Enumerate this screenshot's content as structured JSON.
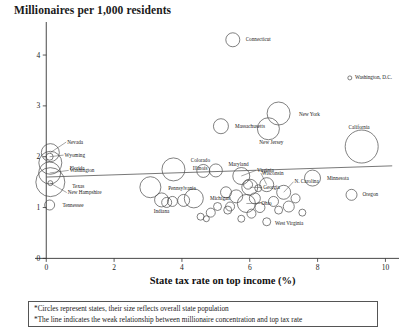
{
  "chart_data": {
    "type": "scatter",
    "title": "Millionaires per 1,000 residents",
    "xlabel": "State tax rate on top income (%)",
    "ylabel": "Millionaires per 1,000 residents",
    "xlim": [
      -0.45,
      10.4
    ],
    "ylim": [
      -0.15,
      4.65
    ],
    "xticks": [
      "0",
      "2",
      "4",
      "6",
      "8",
      "10"
    ],
    "xtickvals": [
      0,
      2,
      4,
      6,
      8,
      10
    ],
    "yticks": [
      "0",
      "1",
      "2",
      "3",
      "4"
    ],
    "ytickvals": [
      0,
      1,
      2,
      3,
      4
    ],
    "grid": false,
    "legend": "none",
    "marker_shape": "open-circle",
    "size_meaning": "overall state population",
    "trendline": {
      "label": "weak positive relationship",
      "x_start": 0.0,
      "y_start": 1.6,
      "x_end": 10.2,
      "y_end": 1.82
    },
    "points": [
      {
        "label": "Connecticut",
        "x": 5.5,
        "y": 4.3,
        "r": 7.0,
        "label_dx": 9,
        "label_dy": 1.5,
        "leader": false
      },
      {
        "label": "Washington, D.C.",
        "x": 8.95,
        "y": 3.55,
        "r": 2.0,
        "label_dx": 4,
        "label_dy": 1.5,
        "leader": false
      },
      {
        "label": "New York",
        "x": 6.85,
        "y": 2.85,
        "r": 11.5,
        "label_dx": 14,
        "label_dy": 2.0,
        "leader": false
      },
      {
        "label": "New Jersey",
        "x": 6.55,
        "y": 2.55,
        "r": 11.0,
        "label_dx": -3,
        "label_dy": 15.0,
        "leader": false
      },
      {
        "label": "Massachusetts",
        "x": 5.15,
        "y": 2.6,
        "r": 7.5,
        "label_dx": 10,
        "label_dy": 1.5,
        "leader": false
      },
      {
        "label": "California",
        "x": 9.3,
        "y": 2.2,
        "r": 16.5,
        "label_dx": -4,
        "label_dy": -18.0,
        "leader": false
      },
      {
        "label": "Nevada",
        "x": 0.12,
        "y": 2.08,
        "r": 9.0,
        "label_dx": 12,
        "label_dy": -9.0,
        "leader": true
      },
      {
        "label": "Wyoming",
        "x": 0.1,
        "y": 2.0,
        "r": 3.5,
        "label_dx": 13,
        "label_dy": 0.0,
        "leader": true
      },
      {
        "label": "Florida",
        "x": 0.12,
        "y": 1.88,
        "r": 11.5,
        "label_dx": 13,
        "label_dy": 7.0,
        "leader": false
      },
      {
        "label": "Washington",
        "x": 0.1,
        "y": 1.68,
        "r": 11.0,
        "label_dx": 14,
        "label_dy": -1.0,
        "leader": true
      },
      {
        "label": "Texas",
        "x": 0.12,
        "y": 1.5,
        "r": 14.5,
        "label_dx": 14,
        "label_dy": 6.0,
        "leader": false
      },
      {
        "label": "New Hampshire",
        "x": 0.12,
        "y": 1.48,
        "r": 2.5,
        "label_dx": 16,
        "label_dy": 11.0,
        "leader": true
      },
      {
        "label": "Tennessee",
        "x": 0.1,
        "y": 1.05,
        "r": 5.0,
        "label_dx": 10,
        "label_dy": 1.5,
        "leader": false
      },
      {
        "label": "Illinois",
        "x": 3.75,
        "y": 1.75,
        "r": 11.5,
        "label_dx": 13,
        "label_dy": 1.0,
        "leader": false
      },
      {
        "label": "Colorado",
        "x": 4.63,
        "y": 1.72,
        "r": 6.5,
        "label_dx": -9,
        "label_dy": -9.0,
        "leader": false
      },
      {
        "label": "Maryland",
        "x": 5.0,
        "y": 1.73,
        "r": 6.5,
        "label_dx": 9,
        "label_dy": -4.0,
        "leader": false
      },
      {
        "label": "Virginia",
        "x": 5.75,
        "y": 1.62,
        "r": 8.5,
        "label_dx": 11,
        "label_dy": -4.0,
        "leader": true
      },
      {
        "label": "Minnesota",
        "x": 7.85,
        "y": 1.58,
        "r": 8.0,
        "label_dx": 10,
        "label_dy": 2.0,
        "leader": false
      },
      {
        "label": "Wisconsin",
        "x": 6.5,
        "y": 1.45,
        "r": 7.0,
        "label_dx": -1,
        "label_dy": -10.0,
        "leader": true
      },
      {
        "label": "Georgia",
        "x": 6.0,
        "y": 1.4,
        "r": 8.0,
        "label_dx": 9,
        "label_dy": 2.0,
        "leader": true
      },
      {
        "label": "N. Carolina",
        "x": 7.0,
        "y": 1.3,
        "r": 7.0,
        "label_dx": 7,
        "label_dy": -9.0,
        "leader": true
      },
      {
        "label": "Pennsylvania",
        "x": 3.07,
        "y": 1.4,
        "r": 10.5,
        "label_dx": 12,
        "label_dy": 3.0,
        "leader": false
      },
      {
        "label": "Michigan",
        "x": 4.35,
        "y": 1.18,
        "r": 9.5,
        "label_dx": 11,
        "label_dy": 1.5,
        "leader": false
      },
      {
        "label": "Indiana",
        "x": 3.4,
        "y": 1.15,
        "r": 7.0,
        "label_dx": -4,
        "label_dy": 13.0,
        "leader": false
      },
      {
        "label": "Ohio",
        "x": 5.9,
        "y": 1.08,
        "r": 9.0,
        "label_dx": 10,
        "label_dy": 1.5,
        "leader": true
      },
      {
        "label": "West Virginia",
        "x": 6.5,
        "y": 0.72,
        "r": 4.0,
        "label_dx": 6,
        "label_dy": 3.0,
        "leader": false
      },
      {
        "label": "Oregon",
        "x": 9.0,
        "y": 1.25,
        "r": 5.5,
        "label_dx": 8,
        "label_dy": 1.5,
        "leader": false
      },
      {
        "label": "",
        "x": 4.05,
        "y": 1.14,
        "r": 6.0,
        "label_dx": 0,
        "label_dy": 0,
        "leader": false
      },
      {
        "label": "",
        "x": 3.72,
        "y": 1.12,
        "r": 5.0,
        "label_dx": 0,
        "label_dy": 0,
        "leader": false
      },
      {
        "label": "",
        "x": 3.55,
        "y": 1.1,
        "r": 5.0,
        "label_dx": 0,
        "label_dy": 0,
        "leader": false
      },
      {
        "label": "",
        "x": 5.3,
        "y": 1.3,
        "r": 5.5,
        "label_dx": 0,
        "label_dy": 0,
        "leader": false
      },
      {
        "label": "",
        "x": 5.42,
        "y": 1.02,
        "r": 4.5,
        "label_dx": 0,
        "label_dy": 0,
        "leader": false
      },
      {
        "label": "",
        "x": 5.6,
        "y": 1.22,
        "r": 6.5,
        "label_dx": 0,
        "label_dy": 0,
        "leader": false
      },
      {
        "label": "",
        "x": 5.35,
        "y": 0.95,
        "r": 4.0,
        "label_dx": 0,
        "label_dy": 0,
        "leader": false
      },
      {
        "label": "",
        "x": 5.05,
        "y": 1.02,
        "r": 4.0,
        "label_dx": 0,
        "label_dy": 0,
        "leader": false
      },
      {
        "label": "",
        "x": 4.85,
        "y": 0.9,
        "r": 4.5,
        "label_dx": 0,
        "label_dy": 0,
        "leader": false
      },
      {
        "label": "",
        "x": 6.15,
        "y": 1.18,
        "r": 5.5,
        "label_dx": 0,
        "label_dy": 0,
        "leader": false
      },
      {
        "label": "",
        "x": 6.3,
        "y": 1.0,
        "r": 5.0,
        "label_dx": 0,
        "label_dy": 0,
        "leader": false
      },
      {
        "label": "",
        "x": 6.05,
        "y": 0.88,
        "r": 4.5,
        "label_dx": 0,
        "label_dy": 0,
        "leader": false
      },
      {
        "label": "",
        "x": 6.7,
        "y": 1.12,
        "r": 5.0,
        "label_dx": 0,
        "label_dy": 0,
        "leader": false
      },
      {
        "label": "",
        "x": 6.85,
        "y": 0.95,
        "r": 4.0,
        "label_dx": 0,
        "label_dy": 0,
        "leader": false
      },
      {
        "label": "",
        "x": 7.15,
        "y": 1.02,
        "r": 5.5,
        "label_dx": 0,
        "label_dy": 0,
        "leader": false
      },
      {
        "label": "",
        "x": 7.35,
        "y": 1.18,
        "r": 4.5,
        "label_dx": 0,
        "label_dy": 0,
        "leader": false
      },
      {
        "label": "",
        "x": 7.55,
        "y": 0.9,
        "r": 3.5,
        "label_dx": 0,
        "label_dy": 0,
        "leader": false
      },
      {
        "label": "",
        "x": 5.75,
        "y": 0.78,
        "r": 3.5,
        "label_dx": 0,
        "label_dy": 0,
        "leader": false
      },
      {
        "label": "",
        "x": 4.55,
        "y": 0.82,
        "r": 3.5,
        "label_dx": 0,
        "label_dy": 0,
        "leader": false
      },
      {
        "label": "",
        "x": 4.72,
        "y": 0.78,
        "r": 3.0,
        "label_dx": 0,
        "label_dy": 0,
        "leader": false
      },
      {
        "label": "",
        "x": 5.95,
        "y": 1.45,
        "r": 4.5,
        "label_dx": 0,
        "label_dy": 0,
        "leader": false
      },
      {
        "label": "",
        "x": 6.25,
        "y": 1.38,
        "r": 3.5,
        "label_dx": 0,
        "label_dy": 0,
        "leader": false
      }
    ]
  },
  "footnotes": [
    "*Circles represent states, their size reflects overall state population",
    "*The line indicates the weak relationship between millionaire concentration and top tax rate"
  ]
}
